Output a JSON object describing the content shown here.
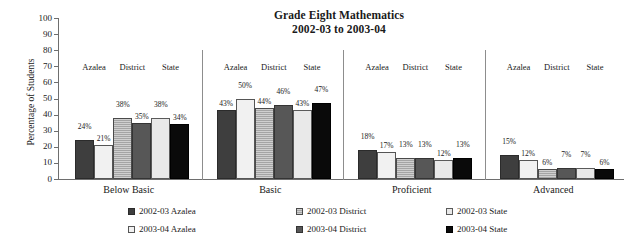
{
  "chart_data": {
    "type": "bar",
    "title": "Grade Eight Mathematics",
    "subtitle": "2002-03 to 2003-04",
    "xlabel": "",
    "ylabel": "Percentage of Students",
    "ylim": [
      0,
      100
    ],
    "ytick_step": 10,
    "yticks": [
      100,
      90,
      80,
      70,
      60,
      50,
      40,
      30,
      20,
      10,
      0
    ],
    "grid": false,
    "legend_position": "bottom",
    "categories": [
      "Below Basic",
      "Basic",
      "Proficient",
      "Advanced"
    ],
    "subgroups": [
      "Azalea",
      "District",
      "State"
    ],
    "series": [
      {
        "name": "2002-03 Azalea",
        "subgroup": "Azalea",
        "year": "2002-03",
        "color": "#3e3e3e",
        "values": [
          24,
          43,
          18,
          15
        ],
        "labels": [
          "24%",
          "43%",
          "18%",
          "15%"
        ]
      },
      {
        "name": "2003-04 Azalea",
        "subgroup": "Azalea",
        "year": "2003-04",
        "color": "#f1f1f1",
        "values": [
          21,
          50,
          17,
          12
        ],
        "labels": [
          "21%",
          "50%",
          "17%",
          "12%"
        ]
      },
      {
        "name": "2002-03 District",
        "subgroup": "District",
        "year": "2002-03",
        "color": "#b9b9b9",
        "values": [
          38,
          44,
          13,
          6
        ],
        "labels": [
          "38%",
          "44%",
          "13%",
          "6%"
        ]
      },
      {
        "name": "2003-04 District",
        "subgroup": "District",
        "year": "2003-04",
        "color": "#575757",
        "values": [
          35,
          46,
          13,
          7
        ],
        "labels": [
          "35%",
          "46%",
          "13%",
          "7%"
        ]
      },
      {
        "name": "2002-03 State",
        "subgroup": "State",
        "year": "2002-03",
        "color": "#e9e9e9",
        "values": [
          38,
          43,
          12,
          7
        ],
        "labels": [
          "38%",
          "43%",
          "12%",
          "7%"
        ]
      },
      {
        "name": "2003-04 State",
        "subgroup": "State",
        "year": "2003-04",
        "color": "#0a0a0a",
        "values": [
          34,
          47,
          13,
          6
        ],
        "labels": [
          "34%",
          "47%",
          "13%",
          "6%"
        ]
      }
    ]
  },
  "axis": {
    "ylabel": "Percentage of Students",
    "ticks": {
      "t100": "100",
      "t90": "90",
      "t80": "80",
      "t70": "70",
      "t60": "60",
      "t50": "50",
      "t40": "40",
      "t30": "30",
      "t20": "20",
      "t10": "10",
      "t0": "0"
    }
  },
  "title": {
    "line1": "Grade Eight Mathematics",
    "line2": "2002-03 to 2003-04"
  },
  "groups": [
    {
      "name": "Below Basic",
      "sublabels": [
        "Azalea",
        "District",
        "State"
      ],
      "bars": [
        {
          "label": "24%",
          "value": 24,
          "style": "f-azalea-02"
        },
        {
          "label": "21%",
          "value": 21,
          "style": "f-azalea-03"
        },
        {
          "label": "38%",
          "value": 38,
          "style": "f-district-02"
        },
        {
          "label": "35%",
          "value": 35,
          "style": "f-district-03"
        },
        {
          "label": "38%",
          "value": 38,
          "style": "f-state-02"
        },
        {
          "label": "34%",
          "value": 34,
          "style": "f-state-03"
        }
      ]
    },
    {
      "name": "Basic",
      "sublabels": [
        "Azalea",
        "District",
        "State"
      ],
      "bars": [
        {
          "label": "43%",
          "value": 43,
          "style": "f-azalea-02"
        },
        {
          "label": "50%",
          "value": 50,
          "style": "f-azalea-03"
        },
        {
          "label": "44%",
          "value": 44,
          "style": "f-district-02"
        },
        {
          "label": "46%",
          "value": 46,
          "style": "f-district-03"
        },
        {
          "label": "43%",
          "value": 43,
          "style": "f-state-02"
        },
        {
          "label": "47%",
          "value": 47,
          "style": "f-state-03"
        }
      ]
    },
    {
      "name": "Proficient",
      "sublabels": [
        "Azalea",
        "District",
        "State"
      ],
      "bars": [
        {
          "label": "18%",
          "value": 18,
          "style": "f-azalea-02"
        },
        {
          "label": "17%",
          "value": 17,
          "style": "f-azalea-03"
        },
        {
          "label": "13%",
          "value": 13,
          "style": "f-district-02"
        },
        {
          "label": "13%",
          "value": 13,
          "style": "f-district-03"
        },
        {
          "label": "12%",
          "value": 12,
          "style": "f-state-02"
        },
        {
          "label": "13%",
          "value": 13,
          "style": "f-state-03"
        }
      ]
    },
    {
      "name": "Advanced",
      "sublabels": [
        "Azalea",
        "District",
        "State"
      ],
      "bars": [
        {
          "label": "15%",
          "value": 15,
          "style": "f-azalea-02"
        },
        {
          "label": "12%",
          "value": 12,
          "style": "f-azalea-03"
        },
        {
          "label": "6%",
          "value": 6,
          "style": "f-district-02"
        },
        {
          "label": "7%",
          "value": 7,
          "style": "f-district-03"
        },
        {
          "label": "7%",
          "value": 7,
          "style": "f-state-02"
        },
        {
          "label": "6%",
          "value": 6,
          "style": "f-state-03"
        }
      ]
    }
  ],
  "legend": {
    "items": [
      {
        "label": "2002-03 Azalea",
        "style": "f-azalea-02",
        "col": 0,
        "row": 0
      },
      {
        "label": "2003-04 Azalea",
        "style": "f-azalea-03",
        "col": 0,
        "row": 1
      },
      {
        "label": "2002-03 District",
        "style": "f-district-02",
        "col": 1,
        "row": 0
      },
      {
        "label": "2003-04 District",
        "style": "f-district-03",
        "col": 1,
        "row": 1
      },
      {
        "label": "2002-03 State",
        "style": "f-state-02",
        "col": 2,
        "row": 0
      },
      {
        "label": "2003-04 State",
        "style": "f-state-03",
        "col": 2,
        "row": 1
      }
    ]
  }
}
